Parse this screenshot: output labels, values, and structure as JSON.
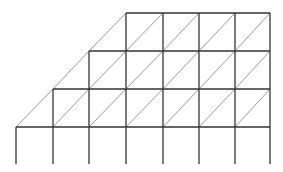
{
  "diagram": {
    "type": "stepped-truss-grid",
    "columns_x": [
      16,
      53,
      89,
      126,
      163,
      199,
      235,
      270
    ],
    "rows_y": [
      13,
      51,
      89,
      127
    ],
    "bottom_y": 164,
    "row_start_col": [
      3,
      2,
      1,
      0
    ],
    "colors": {
      "frame": "#333333",
      "diagonal": "#999999",
      "background": "#ffffff"
    }
  }
}
